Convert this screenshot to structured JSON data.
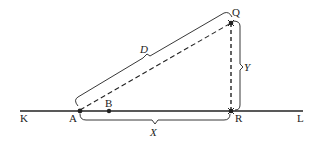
{
  "diagram": {
    "type": "geometry-figure",
    "points": {
      "K": "K",
      "A": "A",
      "B": "B",
      "R": "R",
      "L": "L",
      "Q": "Q"
    },
    "measures": {
      "D": "D",
      "X": "X",
      "Y": "Y"
    },
    "colors": {
      "stroke": "#222222",
      "background": "#ffffff"
    }
  }
}
